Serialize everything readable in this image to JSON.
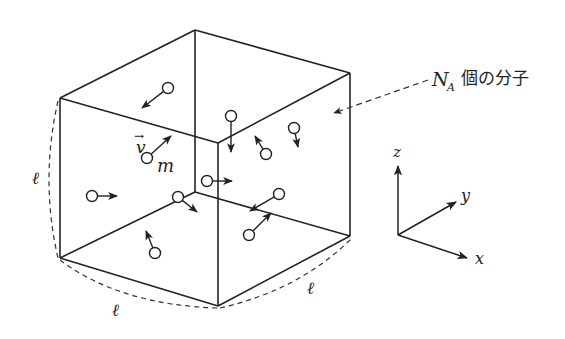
{
  "figure": {
    "labels": {
      "edge_left": "ℓ",
      "edge_front_left": "ℓ",
      "edge_front_right": "ℓ",
      "velocity": "v",
      "velocity_arrow": "→",
      "mass": "m",
      "molecules_N": "N",
      "molecules_sub": "A",
      "molecules_text": "個の分子",
      "axis_x": "x",
      "axis_y": "y",
      "axis_z": "z"
    },
    "colors": {
      "line": "#222222",
      "background": "#ffffff"
    },
    "cube": {
      "back_top": [
        195,
        30
      ],
      "left_top": [
        60,
        98
      ],
      "right_top": [
        350,
        73
      ],
      "front_top": [
        218,
        143
      ],
      "left_bottom": [
        60,
        258
      ],
      "front_bottom": [
        218,
        306
      ],
      "right_bottom": [
        350,
        236
      ],
      "back_bottom": [
        195,
        192
      ]
    },
    "molecules": [
      {
        "c": [
          168,
          88
        ],
        "tip": [
          142,
          108
        ]
      },
      {
        "c": [
          231,
          116
        ],
        "tip": [
          231,
          152
        ]
      },
      {
        "c": [
          266,
          154
        ],
        "tip": [
          255,
          136
        ]
      },
      {
        "c": [
          294,
          128
        ],
        "tip": [
          298,
          147
        ]
      },
      {
        "c": [
          147,
          158
        ],
        "tip": [
          171,
          136
        ]
      },
      {
        "c": [
          92,
          196
        ],
        "tip": [
          117,
          196
        ]
      },
      {
        "c": [
          207,
          181
        ],
        "tip": [
          232,
          181
        ]
      },
      {
        "c": [
          178,
          197
        ],
        "tip": [
          197,
          212
        ]
      },
      {
        "c": [
          279,
          194
        ],
        "tip": [
          250,
          211
        ]
      },
      {
        "c": [
          249,
          235
        ],
        "tip": [
          271,
          213
        ]
      },
      {
        "c": [
          155,
          253
        ],
        "tip": [
          146,
          231
        ]
      }
    ]
  }
}
